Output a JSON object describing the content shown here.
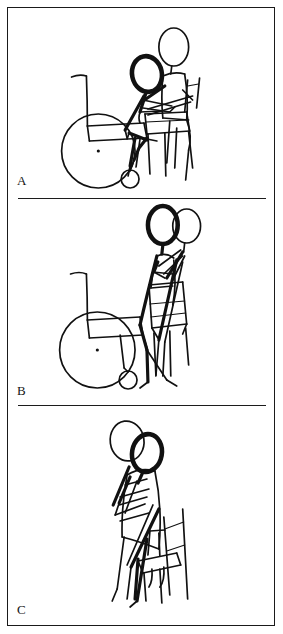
{
  "figure": {
    "type": "line-drawing-figure",
    "border_color": "#1a1a1a",
    "ink_color": "#111111",
    "background_color": "#ffffff",
    "panel_count": 3,
    "panels": [
      {
        "id": "A",
        "label": "A",
        "caption": "",
        "scene": "caregiver-assists-seated-patient-forward-from-wheelchair",
        "elements": [
          "wheelchair-large-rear-wheel",
          "wheelchair-backrest",
          "wheelchair-seat",
          "wheelchair-footplate",
          "wheelchair-caster-wheel",
          "patient-seated-leaning-forward",
          "caregiver-seated-supporting",
          "target-chair"
        ]
      },
      {
        "id": "B",
        "label": "B",
        "caption": "",
        "scene": "patient-rising-to-stand-with-caregiver-support",
        "elements": [
          "wheelchair-large-rear-wheel",
          "wheelchair-backrest",
          "wheelchair-seat",
          "wheelchair-caster-wheel",
          "patient-standing-up",
          "caregiver-supporting-behind",
          "target-chair"
        ]
      },
      {
        "id": "C",
        "label": "C",
        "caption": "",
        "scene": "patient-pivoting-to-sit-onto-chair-with-caregiver",
        "elements": [
          "patient-standing-pivot",
          "caregiver-supporting",
          "target-chair"
        ]
      }
    ]
  }
}
